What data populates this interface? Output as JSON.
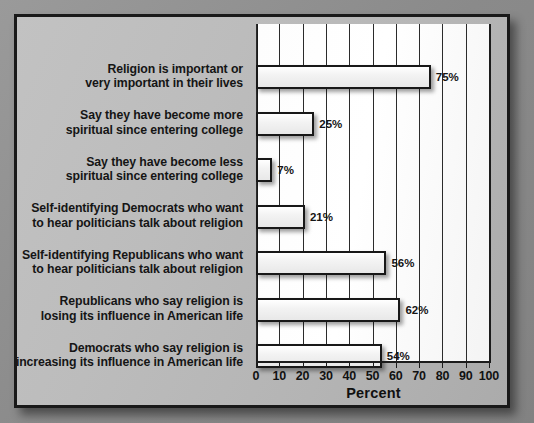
{
  "figure": {
    "background_color": "#b9b9b9",
    "plot_background_color": "#ffffff",
    "frame_color": "#191919",
    "bar_fill_color": "#f0f0f0",
    "bar_border_color": "#181818"
  },
  "chart_data": {
    "type": "bar",
    "orientation": "horizontal",
    "title": "",
    "xlabel": "Percent",
    "ylabel": "",
    "xlim": [
      0,
      100
    ],
    "xticks": [
      0,
      10,
      20,
      30,
      40,
      50,
      60,
      70,
      80,
      90,
      100
    ],
    "xtick_labels": [
      "0",
      "10",
      "20",
      "30",
      "40",
      "50",
      "60",
      "70",
      "80",
      "90",
      "100"
    ],
    "grid": true,
    "grid_axis": "x",
    "legend": null,
    "value_label_suffix": "%",
    "categories": [
      [
        "Religion is important or",
        "very important in their lives"
      ],
      [
        "Say they have become more",
        "spiritual since entering college"
      ],
      [
        "Say they have become less",
        "spiritual since entering college"
      ],
      [
        "Self-identifying Democrats who want",
        "to hear politicians talk about religion"
      ],
      [
        "Self-identifying Republicans who want",
        "to hear politicians talk about religion"
      ],
      [
        "Republicans who say religion is",
        "losing its influence in American life"
      ],
      [
        "Democrats who say religion is",
        "increasing its influence in American life"
      ]
    ],
    "values": [
      75,
      25,
      7,
      21,
      56,
      62,
      54
    ],
    "value_labels": [
      "75%",
      "25%",
      "7%",
      "21%",
      "56%",
      "62%",
      "54%"
    ]
  }
}
